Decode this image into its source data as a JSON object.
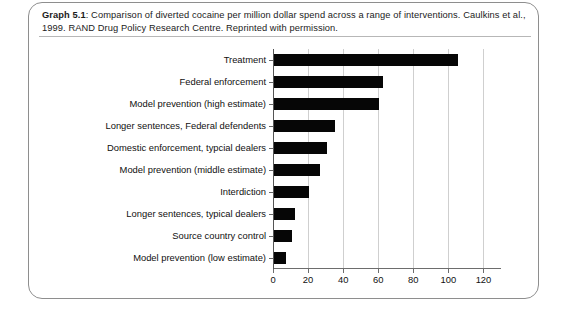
{
  "caption": {
    "label": "Graph 5.1",
    "separator": ":",
    "text": " Comparison of diverted cocaine per million dollar spend across a range of interventions. Caulkins et al., 1999. RAND Drug Policy Research Centre. Reprinted with permission."
  },
  "chart_data": {
    "type": "bar",
    "orientation": "horizontal",
    "title": "",
    "xlabel": "",
    "ylabel": "",
    "xlim": [
      0,
      130
    ],
    "xticks": [
      0,
      20,
      40,
      60,
      80,
      100,
      120
    ],
    "grid": "vertical",
    "legend": "none",
    "bar_color": "#060606",
    "categories": [
      "Treatment",
      "Federal enforcement",
      "Model prevention (high estimate)",
      "Longer sentences, Federal defendents",
      "Domestic enforcement, typcial dealers",
      "Model prevention (middle estimate)",
      "Interdiction",
      "Longer sentences, typical dealers",
      "Source country control",
      "Model prevention (low estimate)"
    ],
    "values": [
      105,
      62,
      60,
      35,
      30,
      26,
      20,
      12,
      10,
      7
    ]
  }
}
